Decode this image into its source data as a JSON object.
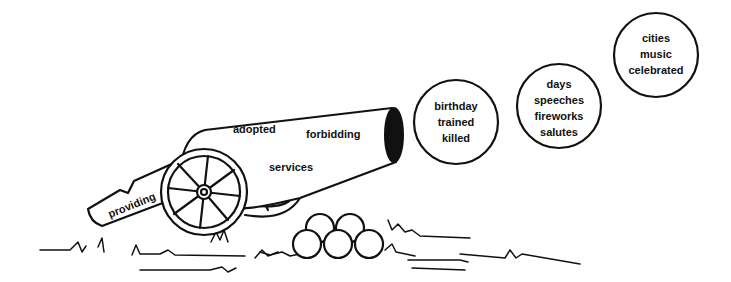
{
  "cannon": {
    "words": [
      {
        "text": "adopted",
        "x": 233,
        "y": 133,
        "rotate": 0
      },
      {
        "text": "forbidding",
        "x": 306,
        "y": 138,
        "rotate": 0
      },
      {
        "text": "services",
        "x": 269,
        "y": 171,
        "rotate": 0
      },
      {
        "text": "providing",
        "x": 110,
        "y": 216,
        "rotate": -22
      }
    ]
  },
  "circles": [
    {
      "cx": 456,
      "cy": 122,
      "r": 42,
      "words": [
        "birthday",
        "trained",
        "killed"
      ]
    },
    {
      "cx": 559,
      "cy": 106,
      "r": 42,
      "words": [
        "days",
        "speeches",
        "fireworks",
        "salutes"
      ]
    },
    {
      "cx": 656,
      "cy": 55,
      "r": 42,
      "words": [
        "cities",
        "music",
        "celebrated"
      ]
    }
  ],
  "cannonballs": [
    {
      "cx": 320,
      "cy": 228,
      "r": 14
    },
    {
      "cx": 350,
      "cy": 228,
      "r": 14
    },
    {
      "cx": 307,
      "cy": 244,
      "r": 14
    },
    {
      "cx": 338,
      "cy": 244,
      "r": 14
    },
    {
      "cx": 369,
      "cy": 244,
      "r": 14
    }
  ]
}
